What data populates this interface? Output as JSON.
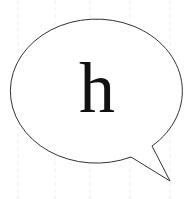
{
  "bubble": {
    "letter": "h",
    "stroke_color": "#333333",
    "fill_color": "#ffffff",
    "text_color": "#111111"
  }
}
